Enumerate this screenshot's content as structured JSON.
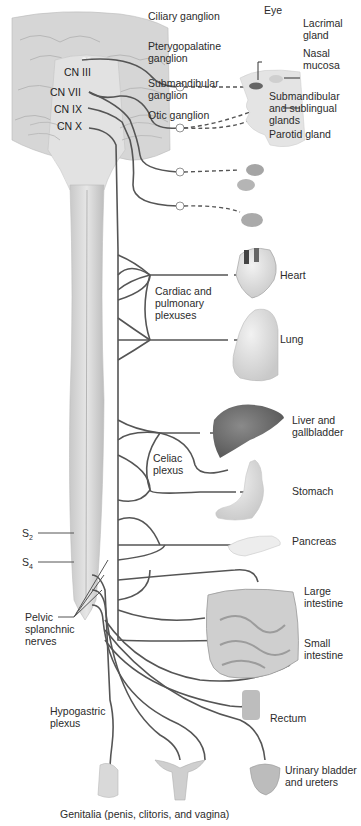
{
  "diagram": {
    "kind": "Parasympathetic (craniosacral) division of the autonomic nervous system",
    "colors": {
      "nerve": "#555555",
      "background": "#ffffff",
      "brain": "#d4d4d4",
      "organ_liver": "#6e6e6e",
      "organ_light": "#dcdcdc"
    },
    "cranial_nerves": [
      {
        "id": "cn3",
        "label": "CN III"
      },
      {
        "id": "cn7",
        "label": "CN VII"
      },
      {
        "id": "cn9",
        "label": "CN IX"
      },
      {
        "id": "cn10",
        "label": "CN X"
      }
    ],
    "sacral": {
      "s2": {
        "base": "S",
        "sub": "2"
      },
      "s4": {
        "base": "S",
        "sub": "4"
      },
      "pelvic_splanchnic": "Pelvic splanchnic nerves"
    },
    "ganglia": [
      {
        "id": "ciliary",
        "label": "Ciliary ganglion"
      },
      {
        "id": "pterygopalatine",
        "label": "Pterygopalatine ganglion"
      },
      {
        "id": "submandibular",
        "label": "Submandibular ganglion"
      },
      {
        "id": "otic",
        "label": "Otic ganglion"
      }
    ],
    "plexuses": [
      {
        "id": "cardiac",
        "label": "Cardiac and pulmonary plexuses"
      },
      {
        "id": "celiac",
        "label": "Celiac plexus"
      },
      {
        "id": "hypogastric",
        "label": "Hypogastric plexus"
      }
    ],
    "targets": [
      {
        "id": "eye",
        "label": "Eye"
      },
      {
        "id": "lacrimal",
        "label": "Lacrimal gland"
      },
      {
        "id": "nasal",
        "label": "Nasal mucosa"
      },
      {
        "id": "submandibular_glands",
        "label": "Submandibular and sublingual glands"
      },
      {
        "id": "parotid",
        "label": "Parotid gland"
      },
      {
        "id": "heart",
        "label": "Heart"
      },
      {
        "id": "lung",
        "label": "Lung"
      },
      {
        "id": "liver",
        "label": "Liver and gallbladder"
      },
      {
        "id": "stomach",
        "label": "Stomach"
      },
      {
        "id": "pancreas",
        "label": "Pancreas"
      },
      {
        "id": "large_intestine",
        "label": "Large intestine"
      },
      {
        "id": "small_intestine",
        "label": "Small intestine"
      },
      {
        "id": "rectum",
        "label": "Rectum"
      },
      {
        "id": "bladder",
        "label": "Urinary bladder and ureters"
      },
      {
        "id": "genitalia",
        "label": "Genitalia (penis, clitoris, and vagina)"
      }
    ]
  }
}
